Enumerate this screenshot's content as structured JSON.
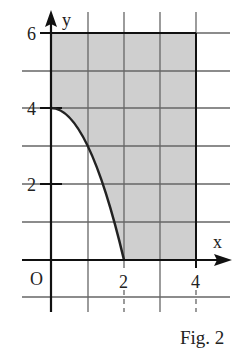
{
  "figure": {
    "caption": "Fig. 2",
    "axes": {
      "x_label": "x",
      "y_label": "y",
      "origin_label": "O"
    },
    "x_ticks": [
      "2",
      "4"
    ],
    "y_ticks": [
      "6",
      "4",
      "2"
    ],
    "curve": "y = 4 - x^2, from (0,4) to (2,0)",
    "shaded_region": "bounded by curve, x-axis from 2 to 4, x = 4, y = 6"
  },
  "colors": {
    "shade": "#cfcfcf",
    "grid": "#555555",
    "axis": "#111111"
  }
}
